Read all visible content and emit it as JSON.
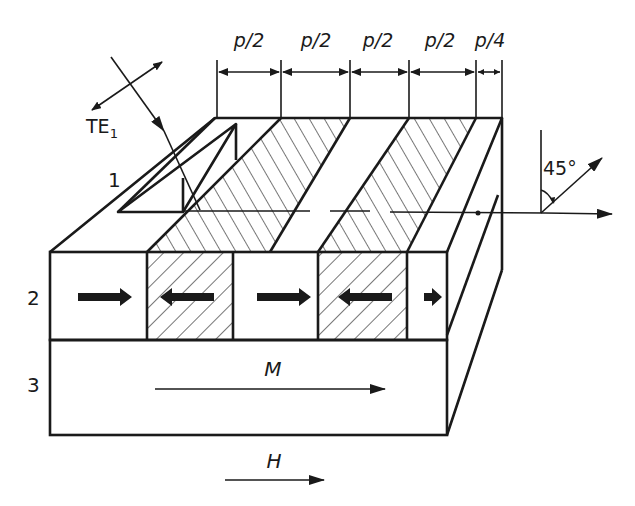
{
  "figure": {
    "dimensions": [
      {
        "label": "p/2"
      },
      {
        "label": "p/2"
      },
      {
        "label": "p/2"
      },
      {
        "label": "p/2"
      },
      {
        "label": "p/4"
      }
    ],
    "incident_wave": {
      "label": "TE",
      "subscript": "1"
    },
    "angle": {
      "label": "45°"
    },
    "layers": [
      {
        "label": "1"
      },
      {
        "label": "2"
      },
      {
        "label": "3"
      }
    ],
    "magnetization": {
      "label": "M"
    },
    "field": {
      "label": "H"
    },
    "domain_arrows": [
      "right",
      "left",
      "right",
      "left",
      "right"
    ],
    "colors": {
      "ink": "#1a1a1a",
      "background": "#ffffff"
    }
  }
}
